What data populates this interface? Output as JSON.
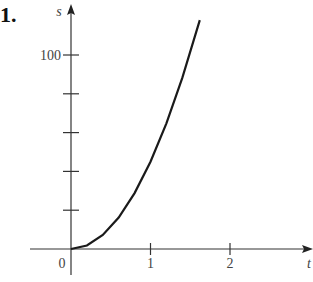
{
  "problem_number": "1.",
  "chart_data": {
    "type": "line",
    "title": "",
    "xlabel": "t",
    "ylabel": "s",
    "x_ticks": [
      0,
      1,
      2
    ],
    "x_tick_labels": [
      "0",
      "1",
      "2"
    ],
    "y_ticks": [
      0,
      20,
      40,
      60,
      80,
      100
    ],
    "y_tick_labels": [
      "",
      "",
      "",
      "",
      "",
      "100"
    ],
    "xlim": [
      0,
      3
    ],
    "ylim": [
      0,
      120
    ],
    "grid": false,
    "series": [
      {
        "name": "s(t)",
        "x": [
          0,
          0.2,
          0.4,
          0.6,
          0.8,
          1.0,
          1.2,
          1.4,
          1.62
        ],
        "values": [
          0,
          1.8,
          7.2,
          16.2,
          28.8,
          45,
          64.8,
          88.2,
          118
        ]
      }
    ]
  }
}
